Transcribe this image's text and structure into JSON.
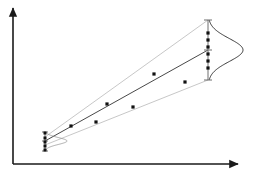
{
  "figure": {
    "title": "",
    "width": 254,
    "height": 171,
    "background": "#ffffff"
  },
  "axes": {
    "x_axis": {
      "name": "x-axis",
      "label": "",
      "x_start": 13,
      "x_end": 238,
      "y": 164,
      "color": "#1a1a1a",
      "arrow": true,
      "ticks": []
    },
    "y_axis": {
      "name": "y-axis",
      "label": "",
      "x": 13,
      "y_start": 164,
      "y_end": 8,
      "color": "#1a1a1a",
      "arrow": true,
      "ticks": []
    }
  },
  "chart_data": {
    "type": "scatter",
    "title": "",
    "subtitle": "",
    "xlabel": "",
    "ylabel": "",
    "xlim": [
      13,
      238
    ],
    "ylim": [
      164,
      8
    ],
    "grid": false,
    "legend": "none",
    "annotations": [],
    "series": [
      {
        "name": "observations",
        "type": "scatter",
        "marker": "filled-square",
        "marker_size": 3.2,
        "color": "#111111",
        "points": [
          {
            "x": 71,
            "y": 126
          },
          {
            "x": 96,
            "y": 122
          },
          {
            "x": 107,
            "y": 104
          },
          {
            "x": 133,
            "y": 107
          },
          {
            "x": 154,
            "y": 74
          },
          {
            "x": 185,
            "y": 82
          }
        ]
      },
      {
        "name": "left-cluster-observations",
        "type": "scatter",
        "marker": "filled-square",
        "marker_size": 3.0,
        "color": "#111111",
        "points": [
          {
            "x": 45,
            "y": 133
          },
          {
            "x": 45,
            "y": 138
          },
          {
            "x": 45,
            "y": 142
          },
          {
            "x": 45,
            "y": 146
          },
          {
            "x": 45,
            "y": 150
          }
        ]
      },
      {
        "name": "right-prediction-observations",
        "type": "scatter",
        "marker": "filled-square",
        "marker_size": 3.2,
        "color": "#111111",
        "points": [
          {
            "x": 208,
            "y": 33
          },
          {
            "x": 208,
            "y": 40
          },
          {
            "x": 208,
            "y": 47
          },
          {
            "x": 208,
            "y": 54
          },
          {
            "x": 208,
            "y": 61
          },
          {
            "x": 208,
            "y": 68
          }
        ]
      }
    ],
    "regression_line": {
      "name": "fitted-regression-line",
      "color": "#333333",
      "width": 0.9,
      "x1": 45,
      "y1": 141,
      "x2": 208,
      "y2": 50
    },
    "confidence_band_upper": {
      "name": "upper-confidence-bound",
      "color": "#b9b9b9",
      "width": 0.8,
      "x1": 45,
      "y1": 137,
      "x2": 208,
      "y2": 20
    },
    "confidence_band_lower": {
      "name": "lower-confidence-bound",
      "color": "#b9b9b9",
      "width": 0.8,
      "x1": 45,
      "y1": 145,
      "x2": 208,
      "y2": 80
    },
    "distribution_right": {
      "name": "right-normal-distribution-curve",
      "color": "#222222",
      "width": 0.9,
      "center_x": 208,
      "center_y": 50,
      "half_height": 30,
      "amplitude": 35,
      "orientation": "vertical-right"
    },
    "distribution_left": {
      "name": "left-normal-distribution-curve",
      "color": "#8a8a8a",
      "width": 0.7,
      "center_x": 45,
      "center_y": 141,
      "half_height": 9,
      "amplitude": 22,
      "orientation": "vertical-right"
    },
    "error_bar_right": {
      "name": "right-error-bar",
      "color": "#6f6f6f",
      "x": 208,
      "y_top": 20,
      "y_bottom": 80,
      "cap_half_width": 4,
      "mean_tick_y": 50
    },
    "error_bar_left": {
      "name": "left-error-bar",
      "color": "#6f6f6f",
      "x": 45,
      "y_top": 132,
      "y_bottom": 151,
      "cap_half_width": 3,
      "mean_tick_y": 141
    }
  }
}
